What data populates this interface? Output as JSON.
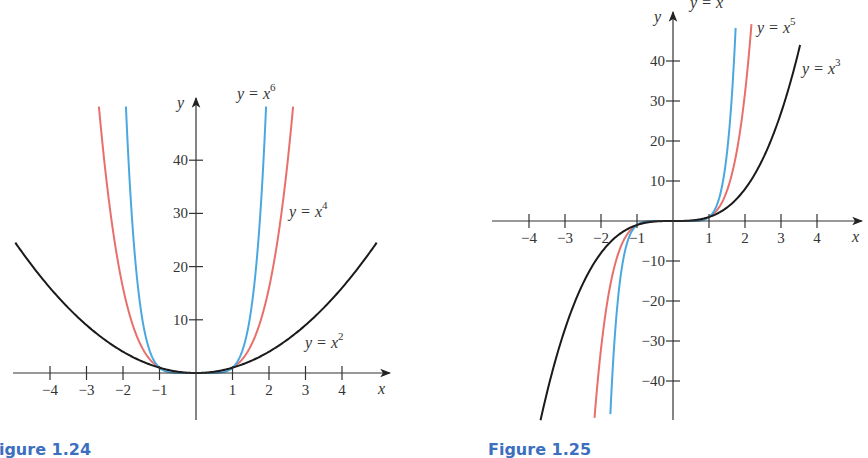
{
  "chart_data": [
    {
      "type": "line",
      "title": "",
      "caption": "Figure 1.24",
      "xlabel": "x",
      "ylabel": "y",
      "xlim": [
        -5.0,
        5.4
      ],
      "ylim": [
        -9,
        52
      ],
      "x_ticks": [
        -4,
        -3,
        -2,
        -1,
        1,
        2,
        3,
        4
      ],
      "x_tick_labels": [
        "−4",
        "−3",
        "−2",
        "−1",
        "1",
        "2",
        "3",
        "4"
      ],
      "y_ticks": [
        10,
        20,
        30,
        40
      ],
      "y_tick_labels": [
        "10",
        "20",
        "30",
        "40"
      ],
      "grid": false,
      "series": [
        {
          "name": "y = x^2",
          "function": "x^2",
          "exponent": 2,
          "color": "#1a1a1a",
          "x_range": [
            -4.95,
            4.95
          ],
          "label_text": "y = x",
          "label_sup": "2"
        },
        {
          "name": "y = x^4",
          "function": "x^4",
          "exponent": 4,
          "color": "#e8706a",
          "x_range": [
            -2.66,
            2.66
          ],
          "label_text": "y = x",
          "label_sup": "4"
        },
        {
          "name": "y = x^6",
          "function": "x^6",
          "exponent": 6,
          "color": "#4aa8e0",
          "x_range": [
            -1.92,
            1.92
          ],
          "label_text": "y = x",
          "label_sup": "6"
        }
      ]
    },
    {
      "type": "line",
      "title": "",
      "caption": "Figure 1.25",
      "xlabel": "x",
      "ylabel": "y",
      "xlim": [
        -5.0,
        5.2
      ],
      "ylim": [
        -50,
        52
      ],
      "x_ticks": [
        -4,
        -3,
        -2,
        -1,
        1,
        2,
        3,
        4
      ],
      "x_tick_labels": [
        "−4",
        "−3",
        "−2",
        "−1",
        "1",
        "2",
        "3",
        "4"
      ],
      "y_ticks": [
        -40,
        -30,
        -20,
        -10,
        10,
        20,
        30,
        40
      ],
      "y_tick_labels": [
        "−40",
        "−30",
        "−20",
        "−10",
        "10",
        "20",
        "30",
        "40"
      ],
      "grid": false,
      "series": [
        {
          "name": "y = x^3",
          "function": "x^3",
          "exponent": 3,
          "color": "#1a1a1a",
          "x_range": [
            -3.68,
            3.53
          ],
          "label_text": "y = x",
          "label_sup": "3"
        },
        {
          "name": "y = x^5",
          "function": "x^5",
          "exponent": 5,
          "color": "#e8706a",
          "x_range": [
            -2.18,
            2.18
          ],
          "label_text": "y = x",
          "label_sup": "5"
        },
        {
          "name": "y = x^7",
          "function": "x^7",
          "exponent": 7,
          "color": "#4aa8e0",
          "x_range": [
            -1.74,
            1.74
          ],
          "label_text": "y = x",
          "label_sup": "7"
        }
      ]
    }
  ]
}
